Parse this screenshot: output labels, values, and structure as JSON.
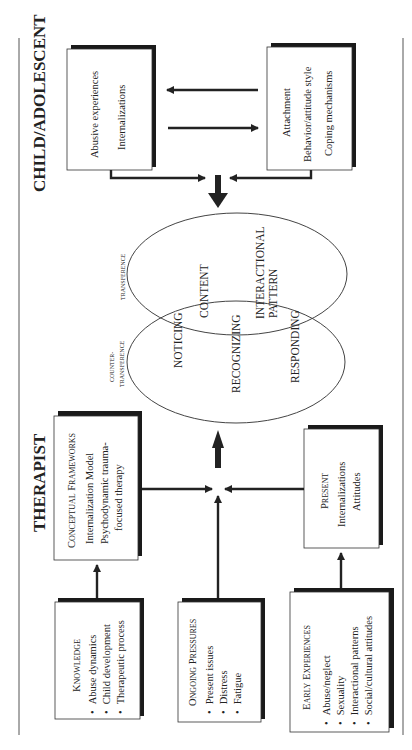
{
  "sections": {
    "child": "CHILD/ADOLESCENT",
    "therapist": "THERAPIST"
  },
  "boxes": {
    "abusive": {
      "lines": [
        "Abusive experiences",
        "Internalizations"
      ]
    },
    "attachment": {
      "lines": [
        "Attachment",
        "Behavior/attitude style",
        "Coping mechanisms"
      ]
    },
    "conceptual": {
      "title_cap": "C",
      "title_rest": "ONCEPTUAL",
      "title_cap2": "F",
      "title_rest2": "RAMEWORKS",
      "lines": [
        "Internalization Model",
        "Psychodynamic trauma-",
        "focused therapy"
      ]
    },
    "present": {
      "title_cap": "P",
      "title_rest": "RESENT",
      "lines": [
        "Internalizations",
        "Attitudes"
      ]
    },
    "knowledge": {
      "title_cap": "K",
      "title_rest": "NOWLEDGE",
      "bullets": [
        "Abuse dynamics",
        "Child development",
        "Therapeutic process"
      ]
    },
    "ongoing": {
      "title_cap": "O",
      "title_rest": "NGOING",
      "title_cap2": "P",
      "title_rest2": "RESSURES",
      "bullets": [
        "Present issues",
        "Distress",
        "Fatigue"
      ]
    },
    "early": {
      "title_cap": "E",
      "title_rest": "ARLY",
      "title_cap2": "E",
      "title_rest2": "XPERIENCES",
      "bullets": [
        "Abuse/neglect",
        "Sexuality",
        "Interactional patterns",
        "Social/cultural attitudes"
      ]
    }
  },
  "ellipses": {
    "transference_label": "TRANSFERENCE",
    "countertransference_label": [
      "COUNTER-",
      "TRANSFERENCE"
    ],
    "content": "CONTENT",
    "interactional": [
      "INTERACTIONAL",
      "PATTERN"
    ],
    "noticing": "NOTICING",
    "recognizing": "RECOGNIZING",
    "responding": "RESPONDING"
  },
  "bullet": "•"
}
